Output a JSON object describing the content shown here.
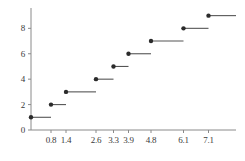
{
  "chart_data": {
    "type": "line",
    "subtype": "step-function-ecdf",
    "title": "",
    "subtitle": "",
    "xlabel": "",
    "ylabel": "",
    "xlim": [
      0,
      8.2
    ],
    "ylim": [
      0,
      9.6
    ],
    "grid": false,
    "legend": null,
    "x_ticks": [
      0.8,
      1.4,
      2.6,
      3.3,
      3.9,
      4.8,
      6.1,
      7.1
    ],
    "x_tick_labels": [
      "0.8",
      "1.4",
      "2.6",
      "3.3",
      "3.9",
      "4.8",
      "6.1",
      "7.1"
    ],
    "y_ticks": [
      0,
      2,
      4,
      6,
      8
    ],
    "y_tick_labels": [
      "0",
      "2",
      "4",
      "6",
      "8"
    ],
    "marker": "filled-circle",
    "marker_color": "#2b2b2b",
    "line_color": "#555555",
    "axis_color": "#8a8a8a",
    "steps": [
      {
        "x_start": 0.0,
        "x_end": 0.8,
        "y": 1,
        "point_x": 0.0,
        "point_y": 1
      },
      {
        "x_start": 0.8,
        "x_end": 1.4,
        "y": 2,
        "point_x": 0.8,
        "point_y": 2
      },
      {
        "x_start": 1.4,
        "x_end": 2.6,
        "y": 3,
        "point_x": 1.4,
        "point_y": 3
      },
      {
        "x_start": 2.6,
        "x_end": 3.3,
        "y": 4,
        "point_x": 2.6,
        "point_y": 4
      },
      {
        "x_start": 3.3,
        "x_end": 3.9,
        "y": 5,
        "point_x": 3.3,
        "point_y": 5
      },
      {
        "x_start": 3.9,
        "x_end": 4.8,
        "y": 6,
        "point_x": 3.9,
        "point_y": 6
      },
      {
        "x_start": 4.8,
        "x_end": 6.1,
        "y": 7,
        "point_x": 4.8,
        "point_y": 7
      },
      {
        "x_start": 6.1,
        "x_end": 7.1,
        "y": 8,
        "point_x": 6.1,
        "point_y": 8
      },
      {
        "x_start": 7.1,
        "x_end": 8.2,
        "y": 9,
        "point_x": 7.1,
        "point_y": 9
      }
    ],
    "x": [
      0.0,
      0.8,
      1.4,
      2.6,
      3.3,
      3.9,
      4.8,
      6.1,
      7.1
    ],
    "values": [
      1,
      2,
      3,
      4,
      5,
      6,
      7,
      8,
      9
    ]
  },
  "geometry": {
    "plot_left": 31,
    "plot_right": 236,
    "axis_y_top": 8,
    "axis_y_baseline": 130,
    "x_tick_len": 3,
    "y_tick_len": 3,
    "marker_radius": 2.2,
    "line_width": 1.1
  }
}
